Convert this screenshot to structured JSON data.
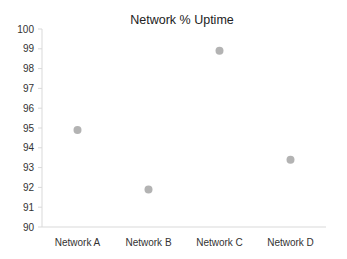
{
  "chart_data": {
    "type": "scatter",
    "title": "Network % Uptime",
    "xlabel": "",
    "ylabel": "",
    "categories": [
      "Network A",
      "Network B",
      "Network C",
      "Network D"
    ],
    "series": [
      {
        "name": "% Uptime",
        "values": [
          94.9,
          91.9,
          98.9,
          93.4
        ],
        "color": "#b3b3b3"
      }
    ],
    "ylim": [
      90,
      100
    ],
    "yticks": [
      90,
      91,
      92,
      93,
      94,
      95,
      96,
      97,
      98,
      99,
      100
    ],
    "grid": false,
    "legend": "none"
  },
  "colors": {
    "axis": "#d9d9d9",
    "marker": "#b3b3b3",
    "text": "#333333"
  }
}
